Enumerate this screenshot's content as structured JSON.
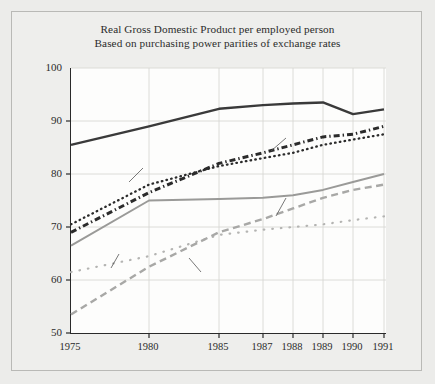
{
  "chart_data": {
    "type": "line",
    "title": "Real Gross Domestic Product per employed person",
    "subtitle": "Based on purchasing power parities of exchange rates",
    "note": "U.S.=100",
    "xlabel": "",
    "ylabel": "",
    "ylim": [
      50,
      100
    ],
    "yticks": [
      50,
      60,
      70,
      80,
      90,
      100
    ],
    "grid": true,
    "legend_position": "inline-annotations",
    "x": [
      "1975",
      "1980",
      "1985",
      "1987",
      "1988",
      "1989",
      "1990",
      "1991"
    ],
    "categories": [
      "1975",
      "1980",
      "1985",
      "1987",
      "1988",
      "1989",
      "1990",
      "1991"
    ],
    "series": [
      {
        "name": "CANADA",
        "style": "solid-thick",
        "color": "#3a3a3a",
        "values": [
          85.5,
          89.0,
          92.3,
          93.0,
          93.3,
          93.5,
          91.3,
          92.2
        ]
      },
      {
        "name": "Italy",
        "style": "fine-dotted",
        "color": "#2b2b2b",
        "values": [
          70.5,
          78.0,
          81.5,
          83.0,
          84.0,
          85.5,
          86.5,
          87.5
        ]
      },
      {
        "name": "France",
        "style": "dash-dot-bold",
        "color": "#2b2b2b",
        "values": [
          69.0,
          76.5,
          82.0,
          84.0,
          85.5,
          87.0,
          87.5,
          89.0
        ]
      },
      {
        "name": "Germany",
        "style": "solid-gray",
        "color": "#9a9a98",
        "values": [
          66.5,
          75.0,
          75.3,
          75.5,
          76.0,
          77.0,
          78.5,
          80.0
        ]
      },
      {
        "name": "Britain",
        "style": "sparse-dotted",
        "color": "#b4b4b2",
        "values": [
          61.5,
          64.5,
          68.5,
          69.5,
          70.0,
          70.5,
          71.3,
          72.0
        ]
      },
      {
        "name": "Japan",
        "style": "dashed-gray",
        "color": "#a8a8a6",
        "values": [
          53.5,
          62.5,
          69.0,
          71.5,
          73.5,
          75.5,
          77.0,
          78.0
        ]
      }
    ],
    "annotations": [
      {
        "text": "CANADA",
        "series": "CANADA"
      },
      {
        "text": "France",
        "series": "France"
      },
      {
        "text": "Italy",
        "series": "Italy"
      },
      {
        "text": "Germany",
        "series": "Germany"
      },
      {
        "text": "Britain",
        "series": "Britain"
      },
      {
        "text": "Japan",
        "series": "Japan"
      }
    ]
  }
}
